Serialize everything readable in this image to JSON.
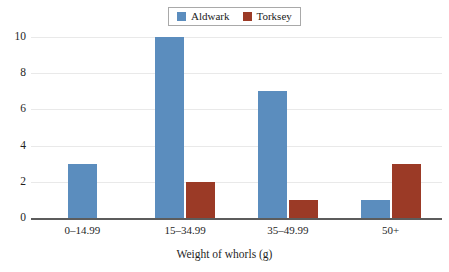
{
  "chart_data": {
    "type": "bar",
    "title": "",
    "xlabel": "Weight of whorls (g)",
    "ylabel": "",
    "categories": [
      "0–14.99",
      "15–34.99",
      "35–49.99",
      "50+"
    ],
    "series": [
      {
        "name": "Aldwark",
        "color": "#5b8dbe",
        "values": [
          3,
          10,
          7,
          1
        ]
      },
      {
        "name": "Torksey",
        "color": "#9b3a26",
        "values": [
          0,
          2,
          1,
          3
        ]
      }
    ],
    "ylim": [
      0,
      10
    ],
    "yticks": [
      0,
      2,
      4,
      6,
      8,
      10
    ],
    "ytick_labels": [
      "0",
      "2",
      "4",
      "6",
      "8",
      "10"
    ],
    "grid": true,
    "grid_axis": "y",
    "legend_position": "top-center",
    "legend_entries": [
      "Aldwark",
      "Torksey"
    ]
  },
  "legend": {
    "entries": [
      {
        "label": "Aldwark",
        "swatch": "legend-swatch-aldwark"
      },
      {
        "label": "Torksey",
        "swatch": "legend-swatch-torksey"
      }
    ]
  },
  "axes": {
    "x_title": "Weight of whorls (g)",
    "x_tick_labels": [
      "0–14.99",
      "15–34.99",
      "35–49.99",
      "50+"
    ],
    "y_tick_labels": [
      "10",
      "8",
      "6",
      "4",
      "2",
      "0"
    ]
  },
  "colors": {
    "aldwark": "#5b8dbe",
    "torksey": "#9b3a26",
    "gridline": "#e9e9e9",
    "axis": "#5c5c5c",
    "background": "#ffffff"
  }
}
